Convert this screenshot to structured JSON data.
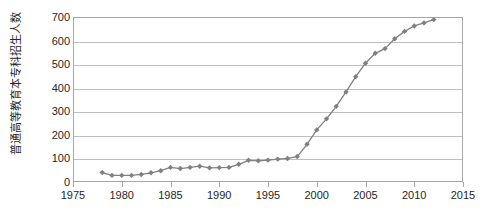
{
  "chart_data": {
    "type": "line",
    "title": "",
    "xlabel": "",
    "ylabel": "普通高等教育本专科招生人数（百万）",
    "ylabel_lines": [
      "普通高等教育本专科招生人数",
      "（百万）"
    ],
    "xlim": [
      1975,
      2015
    ],
    "ylim": [
      0,
      700
    ],
    "y_ticks": [
      0,
      100,
      200,
      300,
      400,
      500,
      600,
      700
    ],
    "x_ticks": [
      1975,
      1980,
      1985,
      1990,
      1995,
      2000,
      2005,
      2010,
      2015
    ],
    "grid": "horizontal",
    "legend": "none",
    "marker": "diamond",
    "series_color": "#808080",
    "grid_color": "#bfbfbf",
    "axis_color": "#a6a6a6",
    "text_color": "#262626",
    "x": [
      1978,
      1979,
      1980,
      1981,
      1982,
      1983,
      1984,
      1985,
      1986,
      1987,
      1988,
      1989,
      1990,
      1991,
      1992,
      1993,
      1994,
      1995,
      1996,
      1997,
      1998,
      1999,
      2000,
      2001,
      2002,
      2003,
      2004,
      2005,
      2006,
      2007,
      2008,
      2009,
      2010,
      2011,
      2012
    ],
    "values": [
      40,
      28,
      28,
      28,
      32,
      39,
      48,
      62,
      57,
      62,
      67,
      60,
      61,
      62,
      75,
      92,
      90,
      93,
      97,
      100,
      108,
      160,
      221,
      268,
      321,
      382,
      447,
      504,
      546,
      566,
      608,
      639,
      662,
      675,
      689
    ],
    "series": [
      {
        "name": "普通高等教育本专科招生人数",
        "values": [
          40,
          28,
          28,
          28,
          32,
          39,
          48,
          62,
          57,
          62,
          67,
          60,
          61,
          62,
          75,
          92,
          90,
          93,
          97,
          100,
          108,
          160,
          221,
          268,
          321,
          382,
          447,
          504,
          546,
          566,
          608,
          639,
          662,
          675,
          689
        ]
      }
    ]
  }
}
